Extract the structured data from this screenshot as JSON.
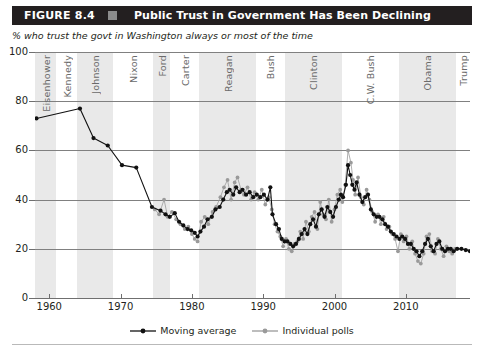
{
  "header": {
    "figure_label": "FIGURE 8.4",
    "title": "Public Trust in Government Has Been Declining",
    "bar_color": "#231f20",
    "square_color": "#8c8c8c"
  },
  "subtitle": "% who trust the govt in Washington always or most of the time",
  "legend": {
    "position": "bottom-center",
    "items": [
      {
        "label": "Moving average",
        "color": "#111111"
      },
      {
        "label": "Individual polls",
        "color": "#9a9a9a"
      }
    ]
  },
  "chart_data": {
    "type": "line",
    "title": "Public Trust in Government Has Been Declining",
    "subtitle": "% who trust the govt in Washington always or most of the time",
    "xlabel": "",
    "ylabel": "% who trust the govt in Washington always or most of the time",
    "xlim": [
      1958,
      2019
    ],
    "ylim": [
      0,
      100
    ],
    "grid": true,
    "y_ticks": [
      0,
      20,
      40,
      60,
      80,
      100
    ],
    "x_ticks": [
      1960,
      1970,
      1980,
      1990,
      2000,
      2010
    ],
    "bands": [
      {
        "label": "Eisenhower",
        "start": 1958,
        "end": 1961,
        "shaded": true
      },
      {
        "label": "Kennedy",
        "start": 1961,
        "end": 1963.9,
        "shaded": false
      },
      {
        "label": "Johnson",
        "start": 1963.9,
        "end": 1969,
        "shaded": true
      },
      {
        "label": "Nixon",
        "start": 1969,
        "end": 1974.6,
        "shaded": false
      },
      {
        "label": "Ford",
        "start": 1974.6,
        "end": 1977,
        "shaded": true
      },
      {
        "label": "Carter",
        "start": 1977,
        "end": 1981,
        "shaded": false
      },
      {
        "label": "Reagan",
        "start": 1981,
        "end": 1989,
        "shaded": true
      },
      {
        "label": "Bush",
        "start": 1989,
        "end": 1993,
        "shaded": false
      },
      {
        "label": "Clinton",
        "start": 1993,
        "end": 2001,
        "shaded": true
      },
      {
        "label": "C.W. Bush",
        "start": 2001,
        "end": 2009,
        "shaded": false
      },
      {
        "label": "Obama",
        "start": 2009,
        "end": 2017,
        "shaded": true
      },
      {
        "label": "Trump",
        "start": 2017,
        "end": 2019,
        "shaded": false
      }
    ],
    "series": [
      {
        "name": "Moving average",
        "color": "#111111",
        "marker": "circle",
        "points": [
          [
            1958.2,
            73
          ],
          [
            1964.3,
            77
          ],
          [
            1966.2,
            65
          ],
          [
            1968.2,
            62
          ],
          [
            1970.2,
            54
          ],
          [
            1972.2,
            53
          ],
          [
            1974.4,
            37
          ],
          [
            1975.6,
            35.5
          ],
          [
            1976.3,
            34
          ],
          [
            1976.9,
            33
          ],
          [
            1977.6,
            34.5
          ],
          [
            1978.2,
            31
          ],
          [
            1978.8,
            29.5
          ],
          [
            1979.4,
            28
          ],
          [
            1979.9,
            27.5
          ],
          [
            1980.4,
            26.5
          ],
          [
            1980.8,
            25
          ],
          [
            1981.2,
            27
          ],
          [
            1981.7,
            29
          ],
          [
            1982.2,
            32
          ],
          [
            1982.8,
            33
          ],
          [
            1983.3,
            36
          ],
          [
            1983.9,
            37
          ],
          [
            1984.4,
            40
          ],
          [
            1984.9,
            43
          ],
          [
            1985.3,
            44
          ],
          [
            1985.8,
            42
          ],
          [
            1986.2,
            45
          ],
          [
            1986.7,
            43
          ],
          [
            1987.1,
            44
          ],
          [
            1987.6,
            42
          ],
          [
            1988.1,
            43
          ],
          [
            1988.6,
            41
          ],
          [
            1989.1,
            42
          ],
          [
            1989.6,
            41
          ],
          [
            1990.1,
            42
          ],
          [
            1990.6,
            40
          ],
          [
            1991.0,
            45
          ],
          [
            1991.3,
            34
          ],
          [
            1991.8,
            30
          ],
          [
            1992.2,
            28
          ],
          [
            1992.6,
            24
          ],
          [
            1993.0,
            23
          ],
          [
            1993.4,
            23
          ],
          [
            1993.8,
            22
          ],
          [
            1994.2,
            21
          ],
          [
            1994.6,
            22
          ],
          [
            1995.0,
            24
          ],
          [
            1995.4,
            26
          ],
          [
            1995.8,
            28
          ],
          [
            1996.2,
            26
          ],
          [
            1996.6,
            30
          ],
          [
            1997.0,
            32
          ],
          [
            1997.4,
            29
          ],
          [
            1997.8,
            34
          ],
          [
            1998.2,
            36
          ],
          [
            1998.6,
            33
          ],
          [
            1999.0,
            37
          ],
          [
            1999.4,
            35
          ],
          [
            1999.8,
            33
          ],
          [
            2000.2,
            37
          ],
          [
            2000.6,
            40
          ],
          [
            2000.9,
            42
          ],
          [
            2001.2,
            41
          ],
          [
            2001.6,
            46
          ],
          [
            2001.9,
            54
          ],
          [
            2002.2,
            50
          ],
          [
            2002.5,
            46
          ],
          [
            2002.8,
            44
          ],
          [
            2003.1,
            47
          ],
          [
            2003.5,
            42
          ],
          [
            2003.9,
            39
          ],
          [
            2004.3,
            41
          ],
          [
            2004.7,
            42
          ],
          [
            2005.1,
            36
          ],
          [
            2005.5,
            34
          ],
          [
            2005.9,
            33
          ],
          [
            2006.3,
            33
          ],
          [
            2006.7,
            32
          ],
          [
            2007.1,
            30
          ],
          [
            2007.5,
            29
          ],
          [
            2007.9,
            27
          ],
          [
            2008.3,
            26
          ],
          [
            2008.7,
            25
          ],
          [
            2009.1,
            24
          ],
          [
            2009.5,
            25
          ],
          [
            2009.9,
            24
          ],
          [
            2010.3,
            22
          ],
          [
            2010.7,
            22
          ],
          [
            2011.1,
            20
          ],
          [
            2011.5,
            19
          ],
          [
            2011.9,
            17
          ],
          [
            2012.3,
            19
          ],
          [
            2012.7,
            22
          ],
          [
            2013.1,
            24
          ],
          [
            2013.5,
            21
          ],
          [
            2013.9,
            19
          ],
          [
            2014.3,
            22
          ],
          [
            2014.7,
            23
          ],
          [
            2015.1,
            20
          ],
          [
            2015.5,
            19
          ],
          [
            2015.9,
            20
          ],
          [
            2016.3,
            20
          ],
          [
            2016.7,
            19
          ],
          [
            2017.2,
            20
          ],
          [
            2017.8,
            20
          ],
          [
            2018.4,
            19.5
          ],
          [
            2019.0,
            19
          ]
        ]
      },
      {
        "name": "Individual polls",
        "color": "#9a9a9a",
        "marker": "circle",
        "points": [
          [
            1974.8,
            36
          ],
          [
            1975.4,
            34
          ],
          [
            1976.1,
            40
          ],
          [
            1976.6,
            33
          ],
          [
            1977.2,
            35
          ],
          [
            1977.8,
            32
          ],
          [
            1978.4,
            30
          ],
          [
            1979.0,
            28
          ],
          [
            1979.5,
            29
          ],
          [
            1980.0,
            26
          ],
          [
            1980.4,
            24
          ],
          [
            1980.8,
            23
          ],
          [
            1981.3,
            31
          ],
          [
            1981.8,
            33
          ],
          [
            1982.3,
            30
          ],
          [
            1982.9,
            35
          ],
          [
            1983.4,
            37
          ],
          [
            1984.0,
            41
          ],
          [
            1984.5,
            45
          ],
          [
            1985.0,
            48
          ],
          [
            1985.5,
            40
          ],
          [
            1986.0,
            47
          ],
          [
            1986.4,
            49
          ],
          [
            1986.9,
            44
          ],
          [
            1987.3,
            42
          ],
          [
            1987.8,
            45
          ],
          [
            1988.3,
            40
          ],
          [
            1988.8,
            43
          ],
          [
            1989.3,
            40
          ],
          [
            1989.8,
            44
          ],
          [
            1990.3,
            38
          ],
          [
            1990.8,
            41
          ],
          [
            1991.2,
            36
          ],
          [
            1991.6,
            30
          ],
          [
            1992.0,
            27
          ],
          [
            1992.4,
            25
          ],
          [
            1992.8,
            21
          ],
          [
            1993.2,
            24
          ],
          [
            1993.6,
            20
          ],
          [
            1994.0,
            19
          ],
          [
            1994.4,
            22
          ],
          [
            1994.8,
            23
          ],
          [
            1995.2,
            27
          ],
          [
            1995.6,
            24
          ],
          [
            1996.0,
            31
          ],
          [
            1996.4,
            27
          ],
          [
            1996.8,
            33
          ],
          [
            1997.2,
            35
          ],
          [
            1997.6,
            28
          ],
          [
            1998.0,
            39
          ],
          [
            1998.4,
            34
          ],
          [
            1998.8,
            32
          ],
          [
            1999.2,
            40
          ],
          [
            1999.6,
            31
          ],
          [
            2000.0,
            36
          ],
          [
            2000.4,
            42
          ],
          [
            2000.8,
            44
          ],
          [
            2001.1,
            39
          ],
          [
            2001.5,
            46
          ],
          [
            2001.9,
            60
          ],
          [
            2002.3,
            55
          ],
          [
            2002.6,
            48
          ],
          [
            2002.9,
            42
          ],
          [
            2003.3,
            49
          ],
          [
            2003.7,
            41
          ],
          [
            2004.1,
            38
          ],
          [
            2004.5,
            44
          ],
          [
            2004.9,
            40
          ],
          [
            2005.3,
            35
          ],
          [
            2005.7,
            31
          ],
          [
            2006.1,
            34
          ],
          [
            2006.5,
            30
          ],
          [
            2006.9,
            33
          ],
          [
            2007.3,
            28
          ],
          [
            2007.7,
            29
          ],
          [
            2008.1,
            26
          ],
          [
            2008.5,
            24
          ],
          [
            2008.9,
            19
          ],
          [
            2009.3,
            26
          ],
          [
            2009.7,
            23
          ],
          [
            2010.1,
            25
          ],
          [
            2010.5,
            20
          ],
          [
            2010.9,
            23
          ],
          [
            2011.3,
            18
          ],
          [
            2011.7,
            15
          ],
          [
            2012.1,
            14
          ],
          [
            2012.5,
            18
          ],
          [
            2012.9,
            25
          ],
          [
            2013.3,
            26
          ],
          [
            2013.7,
            19
          ],
          [
            2014.1,
            18
          ],
          [
            2014.5,
            24
          ],
          [
            2014.9,
            20
          ],
          [
            2015.3,
            17
          ],
          [
            2015.7,
            21
          ],
          [
            2016.1,
            19
          ],
          [
            2016.5,
            18
          ],
          [
            2016.9,
            20
          ]
        ]
      }
    ]
  }
}
